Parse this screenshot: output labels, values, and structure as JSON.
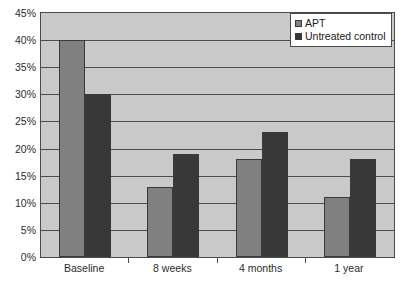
{
  "chart_data": {
    "type": "bar",
    "title": "",
    "subtitle": "",
    "xlabel": "",
    "ylabel": "",
    "categories": [
      "Baseline",
      "8 weeks",
      "4 months",
      "1 year"
    ],
    "series": [
      {
        "name": "APT",
        "values": [
          40,
          13,
          18,
          11
        ],
        "color": "#808080"
      },
      {
        "name": "Untreated control",
        "values": [
          30,
          19,
          23,
          18
        ],
        "color": "#383838"
      }
    ],
    "ylim": [
      0,
      45
    ],
    "ytick_step": 5,
    "ytick_labels": [
      "0%",
      "5%",
      "10%",
      "15%",
      "20%",
      "25%",
      "30%",
      "35%",
      "40%",
      "45%"
    ],
    "ytick_values": [
      0,
      5,
      10,
      15,
      20,
      25,
      30,
      35,
      40,
      45
    ],
    "value_suffix": "%",
    "grid": true,
    "grid_axis": "y",
    "legend_position": "top-right",
    "plot_background": "#c9c9c9",
    "grid_color": "#4d4d4d",
    "axis_color": "#4a4a4a",
    "figure_background": "#ffffff"
  },
  "legend": {
    "items": [
      {
        "label": "APT",
        "swatch": "#808080"
      },
      {
        "label": "Untreated control",
        "swatch": "#383838"
      }
    ]
  }
}
